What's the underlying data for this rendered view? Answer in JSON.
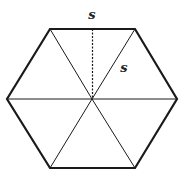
{
  "diagram": {
    "labels": {
      "top_label": "s",
      "side_label": "s"
    },
    "colors": {
      "stroke": "#1a1a1a",
      "background": "#ffffff"
    }
  }
}
